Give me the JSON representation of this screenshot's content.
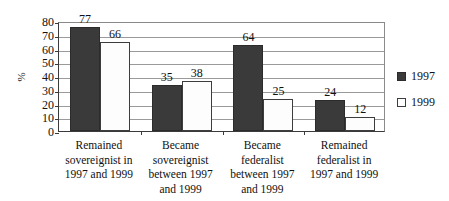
{
  "chart_data": {
    "type": "bar",
    "title": "",
    "xlabel": "",
    "ylabel": "%",
    "ylim": [
      0,
      80
    ],
    "ytick_step": 10,
    "yticks": [
      80,
      70,
      60,
      50,
      40,
      30,
      20,
      10,
      0
    ],
    "grid": true,
    "legend_position": "right",
    "categories": [
      "Remained sovereignist in 1997 and 1999",
      "Became sovereignist between 1997 and 1999",
      "Became federalist between 1997 and 1999",
      "Remained federalist in 1997 and 1999"
    ],
    "category_lines": [
      [
        "Remained",
        "sovereignist in",
        "1997 and 1999"
      ],
      [
        "Became",
        "sovereignist",
        "between 1997",
        "and 1999"
      ],
      [
        "Became",
        "federalist",
        "between 1997",
        "and 1999"
      ],
      [
        "Remained",
        "federalist in",
        "1997 and 1999"
      ]
    ],
    "series": [
      {
        "name": "1997",
        "color": "#3a3a3a",
        "values": [
          77,
          35,
          64,
          24
        ]
      },
      {
        "name": "1999",
        "color": "#ffffff",
        "values": [
          66,
          38,
          25,
          12
        ]
      }
    ]
  },
  "legend": {
    "items": [
      {
        "label": "1997",
        "swatch": "filled-dark-square"
      },
      {
        "label": "1999",
        "swatch": "open-white-square"
      }
    ]
  },
  "axis": {
    "y_label": "%"
  }
}
